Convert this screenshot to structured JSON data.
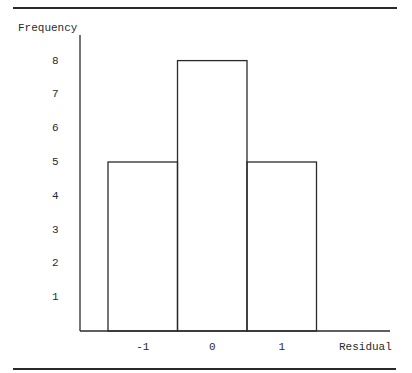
{
  "chart_data": {
    "type": "bar",
    "title": "",
    "xlabel": "Residual",
    "ylabel": "Frequency",
    "categories": [
      "-1",
      "0",
      "1"
    ],
    "values": [
      5,
      8,
      5
    ],
    "yticks": [
      "1",
      "2",
      "3",
      "4",
      "5",
      "6",
      "7",
      "8"
    ],
    "ylim": [
      0,
      8
    ],
    "grid": false,
    "legend": null,
    "histogram": true
  },
  "colors": {
    "line": "#2a2a2a",
    "background": "#ffffff"
  }
}
